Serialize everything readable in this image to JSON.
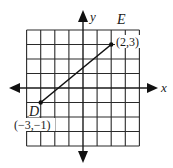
{
  "diagram": {
    "type": "coordinate-grid",
    "grid": {
      "x_min": -4,
      "x_max": 4,
      "y_min": -4,
      "y_max": 4,
      "origin_px": [
        83,
        88
      ],
      "unit_px_x": 14.1,
      "unit_px_y": 14.5,
      "line_color": "#2a2a2a",
      "segment_color": "#111111"
    },
    "axes": {
      "x_label": "x",
      "y_label": "y"
    },
    "points": [
      {
        "name": "D",
        "x": -3,
        "y": -1,
        "coord_label": "(−3,−1)"
      },
      {
        "name": "E",
        "x": 2,
        "y": 3,
        "coord_label": "(2,3)"
      }
    ],
    "segment": {
      "from": "D",
      "to": "E"
    }
  }
}
